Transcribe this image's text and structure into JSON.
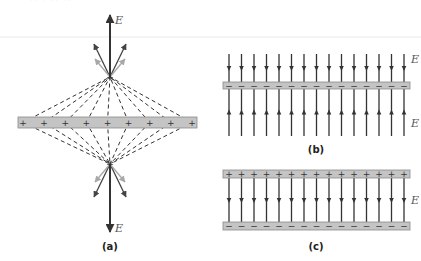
{
  "header": {
    "caption_fragment": "·· · ·· ··",
    "separator_color": "#e6e6e6"
  },
  "colors": {
    "plate_fill": "#c4c4c4",
    "plate_stroke": "#8a8a8a",
    "field_line": "#333333",
    "fan_dark": "#444444",
    "fan_light": "#a8a8a8",
    "dashed": "#333333"
  },
  "panels": {
    "a": {
      "label": "(a)",
      "field_label_top": "E",
      "field_label_bottom": "E",
      "plate": {
        "x1": 18,
        "x2": 197,
        "y": 117,
        "h": 11,
        "charge": "+",
        "charge_count": 9
      },
      "top_point": {
        "x": 110,
        "y": 77
      },
      "bottom_point": {
        "x": 110,
        "y": 164
      },
      "field_arrow_top_end": 15,
      "field_arrow_bottom_end": 232
    },
    "b": {
      "label": "(b)",
      "field_label_top": "E",
      "field_label_bottom": "E",
      "plate": {
        "x1": 223,
        "x2": 410,
        "y": 82,
        "h": 7,
        "charge": "−",
        "charge_count": 15
      },
      "arrow_count": 15,
      "top_arrow_start": 54,
      "bottom_arrow_start": 136,
      "direction": "toward plate"
    },
    "c": {
      "label": "(c)",
      "field_label": "E",
      "top_plate": {
        "x1": 223,
        "x2": 410,
        "y": 170,
        "h": 8,
        "charge": "+",
        "charge_count": 15
      },
      "bottom_plate": {
        "x1": 223,
        "x2": 410,
        "y": 222,
        "h": 8,
        "charge": "−",
        "charge_count": 15
      },
      "arrow_count": 15,
      "direction": "downward (+ to −)"
    }
  }
}
